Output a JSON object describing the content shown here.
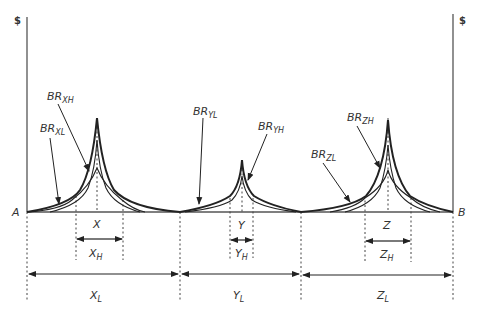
{
  "diagram": {
    "axes": {
      "left_label": "$",
      "right_label": "$",
      "origin_label": "A",
      "end_label": "B"
    },
    "markets": [
      {
        "id": "X",
        "center_label": "X",
        "high_range": {
          "main": "X",
          "sub": "H"
        },
        "low_range": {
          "main": "X",
          "sub": "L"
        },
        "curves": [
          {
            "main": "BR",
            "sub": "XH"
          },
          {
            "main": "BR",
            "sub": "XL"
          }
        ]
      },
      {
        "id": "Y",
        "center_label": "Y",
        "high_range": {
          "main": "Y",
          "sub": "H"
        },
        "low_range": {
          "main": "Y",
          "sub": "L"
        },
        "curves": [
          {
            "main": "BR",
            "sub": "YL"
          },
          {
            "main": "BR",
            "sub": "YH"
          }
        ]
      },
      {
        "id": "Z",
        "center_label": "Z",
        "high_range": {
          "main": "Z",
          "sub": "H"
        },
        "low_range": {
          "main": "Z",
          "sub": "L"
        },
        "curves": [
          {
            "main": "BR",
            "sub": "ZH"
          },
          {
            "main": "BR",
            "sub": "ZL"
          }
        ]
      }
    ],
    "colors": {
      "line": "#222222",
      "text": "#333333",
      "background": "#ffffff"
    }
  }
}
